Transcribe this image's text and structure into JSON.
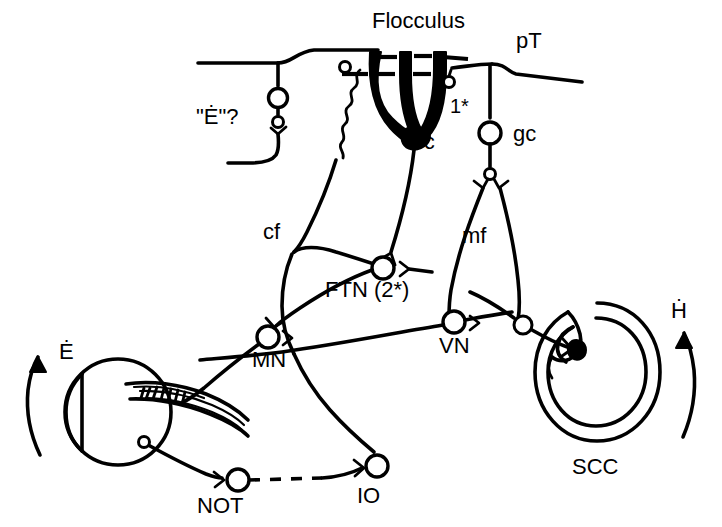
{
  "figure": {
    "background_color": "#ffffff",
    "ink_color": "#000000",
    "width": 722,
    "height": 527
  },
  "labels": {
    "flocculus": "Flocculus",
    "pt": "pT",
    "one_star": "1*",
    "pc": "Pc",
    "gc": "gc",
    "e_dot_query": "\"Ė\"?",
    "cf": "cf",
    "mf": "mf",
    "ftn": "FTN (2*)",
    "mn": "MN",
    "vn": "VN",
    "e_dot": "Ė",
    "h_dot": "Ḣ",
    "not": "NOT",
    "io": "IO",
    "scc": "SCC"
  },
  "structures": [
    {
      "key": "flocculus",
      "name": "Flocculus",
      "description": "cerebellar flocculus cortex region"
    },
    {
      "key": "pc",
      "name": "Pc",
      "description": "Purkinje cell with filled dendritic tree"
    },
    {
      "key": "gc",
      "name": "gc",
      "description": "granule cell"
    },
    {
      "key": "pt",
      "name": "pT",
      "description": "parallel fiber / pretectum input"
    },
    {
      "key": "cf",
      "name": "cf",
      "description": "climbing fiber"
    },
    {
      "key": "mf",
      "name": "mf",
      "description": "mossy fiber"
    },
    {
      "key": "ftn",
      "name": "FTN (2*)",
      "description": "flocculus target neuron, second order"
    },
    {
      "key": "mn",
      "name": "MN",
      "description": "motoneuron"
    },
    {
      "key": "vn",
      "name": "VN",
      "description": "vestibular nucleus neuron"
    },
    {
      "key": "not",
      "name": "NOT",
      "description": "nucleus of the optic tract"
    },
    {
      "key": "io",
      "name": "IO",
      "description": "inferior olive"
    },
    {
      "key": "scc",
      "name": "SCC",
      "description": "semicircular canal"
    }
  ],
  "signals": [
    {
      "key": "e_dot",
      "symbol": "Ė",
      "description": "eye velocity, counterclockwise arrow at eye"
    },
    {
      "key": "h_dot",
      "symbol": "Ḣ",
      "description": "head velocity, counterclockwise arrow at canal"
    },
    {
      "key": "e_dot_query",
      "symbol": "\"Ė\"?",
      "description": "putative eye velocity efference copy signal"
    }
  ],
  "markers": {
    "one_star": "1*",
    "two_star": "2*"
  }
}
